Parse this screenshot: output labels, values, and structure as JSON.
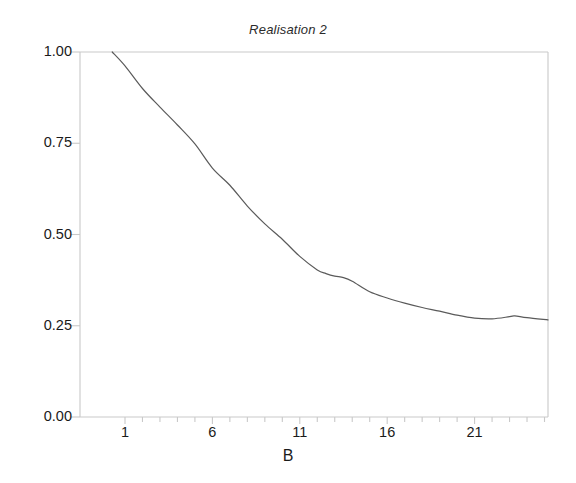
{
  "chart_data": {
    "type": "line",
    "title": "Realisation 2",
    "xlabel": "B",
    "ylabel": "",
    "xlim": [
      0.27,
      25.2
    ],
    "ylim": [
      0.0,
      1.0
    ],
    "grid": false,
    "legend": null,
    "axis_color": "#c9c9c9",
    "line_color": "#5a5a5a",
    "x_ticks": [
      1,
      6,
      11,
      16,
      21
    ],
    "x_tick_labels": [
      "1",
      "6",
      "11",
      "16",
      "21"
    ],
    "y_ticks": [
      0.0,
      0.25,
      0.5,
      0.75,
      1.0
    ],
    "y_tick_labels": [
      "0.00",
      "0.25",
      "0.50",
      "0.75",
      "1.00"
    ],
    "x_minor_tick_step": 1,
    "series": [
      {
        "name": "Realisation 2",
        "x": [
          0.27,
          1.0,
          2.0,
          3.0,
          4.0,
          5.0,
          6.0,
          7.0,
          8.0,
          9.0,
          10.0,
          11.0,
          12.0,
          12.5,
          13.0,
          13.5,
          14.0,
          15.0,
          16.0,
          17.0,
          18.0,
          19.0,
          20.0,
          21.0,
          22.0,
          23.0,
          23.3,
          24.0,
          25.2
        ],
        "y": [
          1.0,
          0.962,
          0.9,
          0.849,
          0.8,
          0.748,
          0.682,
          0.635,
          0.578,
          0.529,
          0.487,
          0.44,
          0.403,
          0.393,
          0.386,
          0.382,
          0.372,
          0.343,
          0.326,
          0.312,
          0.3,
          0.29,
          0.279,
          0.271,
          0.269,
          0.275,
          0.277,
          0.272,
          0.266
        ]
      }
    ]
  },
  "plot_geometry": {
    "left": 80,
    "right": 548,
    "top": 52,
    "bottom": 417
  }
}
